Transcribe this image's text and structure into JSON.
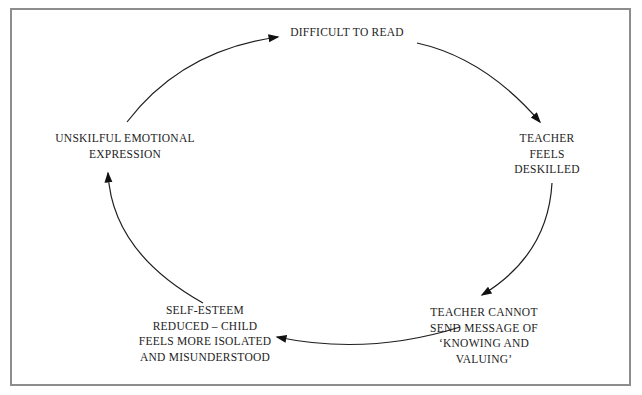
{
  "diagram": {
    "type": "cycle",
    "direction": "clockwise",
    "nodes": [
      {
        "id": "difficult-to-read",
        "label": "DIFFICULT TO READ"
      },
      {
        "id": "teacher-feels-deskilled",
        "label": "TEACHER\nFEELS\nDESKILLED"
      },
      {
        "id": "teacher-cannot-send-message",
        "label": "TEACHER CANNOT\nSEND MESSAGE OF\n‘KNOWING AND\nVALUING’"
      },
      {
        "id": "self-esteem-reduced",
        "label": "SELF-ESTEEM\nREDUCED – CHILD\nFEELS MORE ISOLATED\nAND MISUNDERSTOOD"
      },
      {
        "id": "unskilful-emotional-expression",
        "label": "UNSKILFUL EMOTIONAL\nEXPRESSION"
      }
    ],
    "edges": [
      {
        "from": "difficult-to-read",
        "to": "teacher-feels-deskilled"
      },
      {
        "from": "teacher-feels-deskilled",
        "to": "teacher-cannot-send-message"
      },
      {
        "from": "teacher-cannot-send-message",
        "to": "self-esteem-reduced"
      },
      {
        "from": "self-esteem-reduced",
        "to": "unskilful-emotional-expression"
      },
      {
        "from": "unskilful-emotional-expression",
        "to": "difficult-to-read"
      }
    ],
    "colors": {
      "background": "#ffffff",
      "frame_border": "#8d8d8d",
      "arrow_stroke": "#1f1f1f",
      "text": "#1c1c1c"
    }
  }
}
